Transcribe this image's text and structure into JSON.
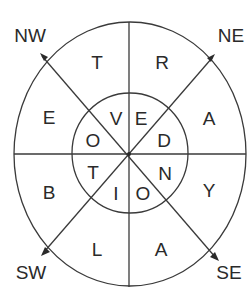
{
  "diagram": {
    "type": "letter-wheel-puzzle",
    "directions": {
      "nw": "NW",
      "ne": "NE",
      "sw": "SW",
      "se": "SE"
    },
    "outer_ring": {
      "top_left": "T",
      "top_right": "R",
      "right_upper": "A",
      "right_lower": "Y",
      "bottom_right": "A",
      "bottom_left": "L",
      "left_lower": "B",
      "left_upper": "E"
    },
    "inner_ring": {
      "top_left": "V",
      "top_right": "E",
      "right_upper": "D",
      "right_lower": "N",
      "bottom_right": "O",
      "bottom_left": "I",
      "left_lower": "T",
      "left_upper": "O"
    },
    "colors": {
      "line": "#3a3a3a",
      "text": "#2a2a2a",
      "background": "#ffffff"
    }
  }
}
